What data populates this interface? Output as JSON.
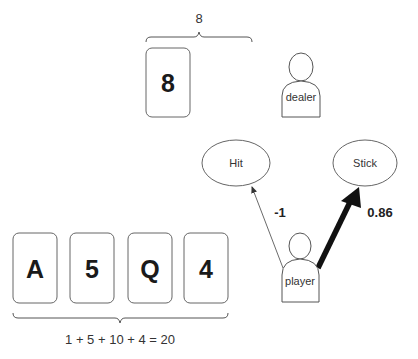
{
  "dealer": {
    "label": "dealer",
    "cards": [
      "8"
    ],
    "sum_label": "8"
  },
  "player": {
    "label": "player",
    "cards": [
      "A",
      "5",
      "Q",
      "4"
    ],
    "sum_label": "1 + 5 + 10 + 4 = 20"
  },
  "actions": [
    {
      "label": "Hit",
      "value_label": "-1"
    },
    {
      "label": "Stick",
      "value_label": "0.86"
    }
  ]
}
